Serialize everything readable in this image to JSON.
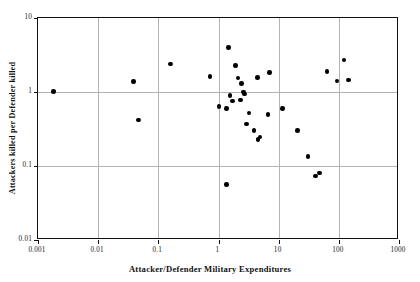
{
  "chart_data": {
    "type": "scatter",
    "title": "",
    "xlabel": "Attacker/Defender Military Expenditures",
    "ylabel": "Attackers killed per Defender killed",
    "xscale": "log",
    "yscale": "log",
    "xlim": [
      0.001,
      1000
    ],
    "ylim": [
      0.01,
      10
    ],
    "xticks": [
      0.001,
      0.01,
      0.1,
      1,
      10,
      100,
      1000
    ],
    "xtick_labels": [
      "0.001",
      "0.01",
      "0.1",
      "1",
      "10",
      "100",
      "1000"
    ],
    "yticks": [
      0.01,
      0.1,
      1,
      10
    ],
    "ytick_labels": [
      "0.01",
      "0.1",
      "1",
      "10"
    ],
    "grid": true,
    "grid_color": "#b4b4b4",
    "marker": "filled-circle",
    "marker_color": "#000000",
    "legend": null,
    "points": [
      {
        "x": 0.0018,
        "y": 1.02
      },
      {
        "x": 0.039,
        "y": 1.38
      },
      {
        "x": 0.047,
        "y": 0.42
      },
      {
        "x": 0.16,
        "y": 2.4
      },
      {
        "x": 0.72,
        "y": 1.62
      },
      {
        "x": 1.02,
        "y": 0.64
      },
      {
        "x": 1.35,
        "y": 0.6
      },
      {
        "x": 1.45,
        "y": 4.0
      },
      {
        "x": 1.9,
        "y": 2.3
      },
      {
        "x": 1.55,
        "y": 0.9
      },
      {
        "x": 2.1,
        "y": 1.55
      },
      {
        "x": 2.4,
        "y": 1.3
      },
      {
        "x": 1.7,
        "y": 0.76
      },
      {
        "x": 2.3,
        "y": 0.78
      },
      {
        "x": 2.6,
        "y": 1.0
      },
      {
        "x": 2.7,
        "y": 0.94
      },
      {
        "x": 3.2,
        "y": 0.52
      },
      {
        "x": 2.9,
        "y": 0.37
      },
      {
        "x": 3.9,
        "y": 0.3
      },
      {
        "x": 4.5,
        "y": 0.23
      },
      {
        "x": 4.9,
        "y": 0.245
      },
      {
        "x": 4.4,
        "y": 1.58
      },
      {
        "x": 1.35,
        "y": 0.056
      },
      {
        "x": 7.0,
        "y": 1.85
      },
      {
        "x": 6.6,
        "y": 0.5
      },
      {
        "x": 11.5,
        "y": 0.6
      },
      {
        "x": 20.5,
        "y": 0.3
      },
      {
        "x": 30.5,
        "y": 0.135
      },
      {
        "x": 41.0,
        "y": 0.073
      },
      {
        "x": 48.0,
        "y": 0.08
      },
      {
        "x": 64.0,
        "y": 1.9
      },
      {
        "x": 93.0,
        "y": 1.4
      },
      {
        "x": 122.0,
        "y": 2.7
      },
      {
        "x": 145.0,
        "y": 1.45
      }
    ]
  },
  "axes": {
    "x_title": "Attacker/Defender Military Expenditures",
    "y_title": "Attackers killed per Defender killed"
  }
}
